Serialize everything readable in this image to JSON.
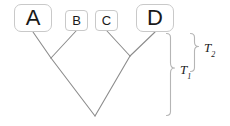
{
  "figure": {
    "kind": "phylogenetic-tree-diagram",
    "width": 230,
    "height": 126,
    "background_color": "#ffffff",
    "line_color": "#8c8c8c",
    "box_border_color": "#c9c9c9",
    "text_color": "#1a1a1a"
  },
  "taxa": [
    {
      "id": "A",
      "label": "A",
      "size": "large",
      "x": 14,
      "y": 4,
      "w": 38,
      "h": 28,
      "tip_x": 33,
      "tip_y": 32
    },
    {
      "id": "B",
      "label": "B",
      "size": "small",
      "x": 65,
      "y": 10,
      "w": 23,
      "h": 21,
      "tip_x": 76,
      "tip_y": 31
    },
    {
      "id": "C",
      "label": "C",
      "size": "small",
      "x": 95,
      "y": 10,
      "w": 23,
      "h": 21,
      "tip_x": 107,
      "tip_y": 31
    },
    {
      "id": "D",
      "label": "D",
      "size": "large",
      "x": 136,
      "y": 4,
      "w": 38,
      "h": 28,
      "tip_x": 155,
      "tip_y": 32
    }
  ],
  "nodes": {
    "ab_node": {
      "x": 51,
      "y": 58
    },
    "cd_node": {
      "x": 130,
      "y": 56
    },
    "root": {
      "x": 95,
      "y": 116
    }
  },
  "braces": {
    "outer": {
      "label": "T",
      "subscript": "1",
      "x": 170,
      "y_top": 33,
      "y_bottom": 116,
      "label_x": 186,
      "label_y": 68
    },
    "inner": {
      "label": "T",
      "subscript": "2",
      "x": 194,
      "y_top": 33,
      "y_bottom": 72,
      "label_x": 209,
      "label_y": 46
    }
  }
}
